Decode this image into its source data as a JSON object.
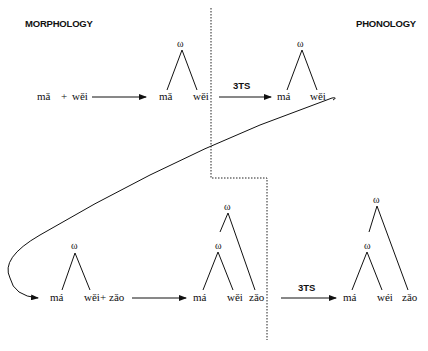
{
  "headers": {
    "left": "MORPHOLOGY",
    "right": "PHONOLOGY"
  },
  "omega": "ω",
  "plus": "+",
  "rule_label": "3TS",
  "row1": {
    "input": [
      "mǎ",
      "wěi"
    ],
    "morph_tree": [
      "mǎ",
      "wěi"
    ],
    "phon_tree": [
      "má",
      "wěi"
    ]
  },
  "row2": {
    "input_tree": [
      "má",
      "wěi"
    ],
    "added": "zǎo",
    "morph_tree": [
      "má",
      "wěi",
      "zǎo"
    ],
    "phon_tree": [
      "má",
      "wéi",
      "zǎo"
    ]
  }
}
